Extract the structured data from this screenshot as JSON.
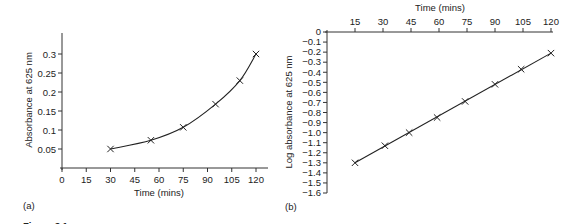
{
  "figure_caption_partial": "Figure 3.1",
  "chart_data": [
    {
      "panel": "(a)",
      "type": "line",
      "title": "",
      "xlabel": "Time (mins)",
      "ylabel": "Absorbance at 625 nm",
      "xlim": [
        0,
        120
      ],
      "ylim": [
        0,
        0.3
      ],
      "x_ticks": [
        "0",
        "15",
        "30",
        "45",
        "60",
        "75",
        "90",
        "105",
        "120"
      ],
      "y_ticks": [
        "0.05",
        "0.1",
        "0.15",
        "0.2",
        "0.25",
        "0.3"
      ],
      "grid": false,
      "legend": null,
      "marker": "x",
      "curve": "smooth exponential fit",
      "x": [
        30,
        55,
        75,
        95,
        110,
        120
      ],
      "y": [
        0.05,
        0.073,
        0.107,
        0.168,
        0.23,
        0.3
      ]
    },
    {
      "panel": "(b)",
      "type": "line",
      "title": "",
      "xlabel": "Time (mins)",
      "xlabel_position": "top",
      "ylabel": "Log absorbance at 625 nm",
      "xlim": [
        0,
        120
      ],
      "ylim": [
        -1.6,
        0
      ],
      "x_ticks": [
        "15",
        "30",
        "45",
        "60",
        "75",
        "90",
        "105",
        "120"
      ],
      "y_ticks": [
        "0",
        "-0.1",
        "-0.2",
        "-0.3",
        "-0.4",
        "-0.5",
        "-0.6",
        "-0.7",
        "-0.8",
        "-0.9",
        "-1.0",
        "-1.1",
        "-1.2",
        "-1.3",
        "-1.4",
        "-1.5",
        "-1.6"
      ],
      "grid": false,
      "legend": null,
      "marker": "x",
      "curve": "straight line fit",
      "x": [
        15,
        31,
        44,
        59,
        74,
        90,
        104,
        120
      ],
      "y": [
        -1.3,
        -1.13,
        -1.0,
        -0.85,
        -0.69,
        -0.52,
        -0.37,
        -0.21
      ]
    }
  ]
}
